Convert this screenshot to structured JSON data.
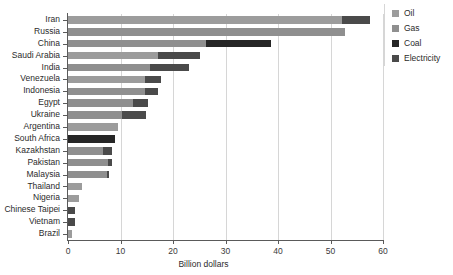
{
  "chart_data": {
    "type": "bar",
    "orientation": "horizontal",
    "stacked": true,
    "title": "",
    "xlabel": "Billion dollars",
    "ylabel": "",
    "xlim": [
      0,
      60
    ],
    "xticks": [
      0,
      10,
      20,
      30,
      40,
      50,
      60
    ],
    "xticklabels": [
      "0",
      "10",
      "20",
      "30",
      "40",
      "50",
      "60"
    ],
    "grid": "vertical",
    "legend_position": "right",
    "categories": [
      "Iran",
      "Russia",
      "China",
      "Saudi Arabia",
      "India",
      "Venezuela",
      "Indonesia",
      "Egypt",
      "Ukraine",
      "Argentina",
      "South Africa",
      "Kazakhstan",
      "Pakistan",
      "Malaysia",
      "Thailand",
      "Nigeria",
      "Chinese Taipei",
      "Vietnam",
      "Brazil"
    ],
    "series": [
      {
        "name": "Oil",
        "color": "#9c9c9c",
        "values": [
          52.2,
          0.0,
          0.0,
          17.1,
          0.0,
          14.7,
          0.0,
          0.0,
          0.0,
          9.5,
          0.0,
          0.0,
          0.0,
          0.0,
          2.7,
          2.1,
          0.0,
          0.0,
          0.8
        ]
      },
      {
        "name": "Gas",
        "color": "#8f8f8f",
        "values": [
          0.0,
          52.8,
          26.3,
          0.0,
          15.6,
          0.0,
          14.7,
          12.4,
          10.3,
          0.0,
          0.0,
          6.7,
          7.6,
          7.4,
          0.0,
          0.0,
          0.0,
          0.0,
          0.0
        ]
      },
      {
        "name": "Coal",
        "color": "#262626",
        "values": [
          0.0,
          0.0,
          12.4,
          0.0,
          0.0,
          0.0,
          0.0,
          0.0,
          0.0,
          0.0,
          9.0,
          0.0,
          0.0,
          0.0,
          0.0,
          0.0,
          0.0,
          0.0,
          0.0
        ]
      },
      {
        "name": "Electricity",
        "color": "#4a4a4a",
        "values": [
          5.3,
          0.0,
          0.0,
          8.0,
          7.4,
          3.0,
          2.5,
          2.9,
          4.6,
          0.0,
          0.0,
          1.7,
          0.8,
          0.4,
          0.0,
          0.0,
          1.4,
          1.4,
          0.0
        ]
      }
    ],
    "totals": [
      57.5,
      52.8,
      38.7,
      25.1,
      23.0,
      17.7,
      17.2,
      15.3,
      14.9,
      9.5,
      9.0,
      8.4,
      8.4,
      7.8,
      2.7,
      2.1,
      1.4,
      1.4,
      0.8
    ]
  },
  "legend": {
    "items": [
      {
        "label": "Oil",
        "color": "#9c9c9c"
      },
      {
        "label": "Gas",
        "color": "#8f8f8f"
      },
      {
        "label": "Coal",
        "color": "#262626"
      },
      {
        "label": "Electricity",
        "color": "#4a4a4a"
      }
    ]
  },
  "colors": {
    "axis": "#5a5a5a",
    "grid": "#d6d6d6",
    "text": "#2b2b2b",
    "background": "#ffffff"
  }
}
